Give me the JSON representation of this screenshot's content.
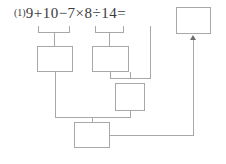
{
  "page": {
    "width": 226,
    "height": 164,
    "background": "#ffffff",
    "line_color": "#a8a8a8",
    "text_color": "#3a3a3a",
    "arrow_color": "#6d6d6d"
  },
  "problem": {
    "index_label": "(1)",
    "expression": "9+10−7×8÷14=",
    "operands": [
      "9",
      "10",
      "7",
      "8",
      "14"
    ],
    "operators": [
      "+",
      "−",
      "×",
      "÷"
    ],
    "equals": "="
  },
  "braces": [
    {
      "name": "brace-9-plus-10",
      "covers": "9+10",
      "value": ""
    },
    {
      "name": "brace-7-times-8",
      "covers": "7×8",
      "value": ""
    }
  ],
  "work_boxes": [
    {
      "name": "step-box-1",
      "value": "",
      "source": "9+10"
    },
    {
      "name": "step-box-2",
      "value": "",
      "source": "7×8"
    },
    {
      "name": "step-box-3",
      "value": "",
      "source": "step-box-2 ÷ 14"
    },
    {
      "name": "step-box-4",
      "value": "",
      "source": "step-box-1 − step-box-3"
    }
  ],
  "answer_box": {
    "name": "answer-box",
    "value": "",
    "placeholder": ""
  }
}
